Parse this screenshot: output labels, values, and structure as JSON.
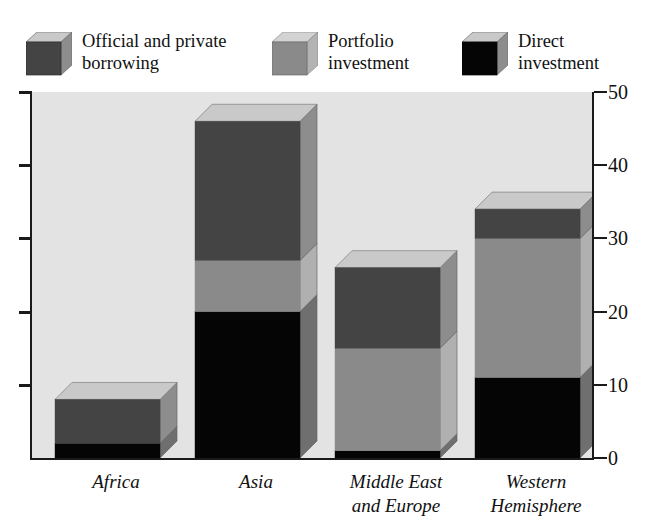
{
  "chart_data": {
    "type": "bar",
    "subtype": "stacked-3d-column",
    "title": "",
    "xlabel": "",
    "ylabel": "",
    "ylim": [
      0,
      50
    ],
    "yticks": [
      0,
      10,
      20,
      30,
      40,
      50
    ],
    "ytick_labels": [
      "0",
      "10",
      "20",
      "30",
      "40",
      "50"
    ],
    "grid": false,
    "legend_position": "top",
    "categories": [
      "Africa",
      "Asia",
      "Middle East and Europe",
      "Western Hemisphere"
    ],
    "category_label_lines": [
      [
        "Africa"
      ],
      [
        "Asia"
      ],
      [
        "Middle East",
        "and Europe"
      ],
      [
        "Western",
        "Hemisphere"
      ]
    ],
    "series": [
      {
        "name": "Direct investment",
        "color": "#050505",
        "values": [
          2,
          20,
          1,
          11
        ]
      },
      {
        "name": "Portfolio investment",
        "color": "#8a8a8a",
        "values": [
          0,
          7,
          14,
          19
        ]
      },
      {
        "name": "Official and private borrowing",
        "color": "#444444",
        "values": [
          6,
          19,
          11,
          4
        ]
      }
    ],
    "stack_totals": [
      8,
      46,
      26,
      34
    ],
    "plot_background": "#e3e3e3",
    "axis_color": "#1a1a1a"
  },
  "legend": {
    "items": [
      {
        "id": "official-private-borrowing",
        "label": "Official and private\nborrowing",
        "color": "#444444",
        "top_color": "#c9c9c9",
        "side_color": "#8d8d8d"
      },
      {
        "id": "portfolio-investment",
        "label": "Portfolio\ninvestment",
        "color": "#8a8a8a",
        "top_color": "#d3d3d3",
        "side_color": "#b3b3b3"
      },
      {
        "id": "direct-investment",
        "label": "Direct\ninvestment",
        "color": "#050505",
        "top_color": "#c9c9c9",
        "side_color": "#8d8d8d"
      }
    ]
  },
  "axis": {
    "tick_labels": [
      "50",
      "40",
      "30",
      "20",
      "10",
      "0"
    ]
  },
  "top_caption": ""
}
